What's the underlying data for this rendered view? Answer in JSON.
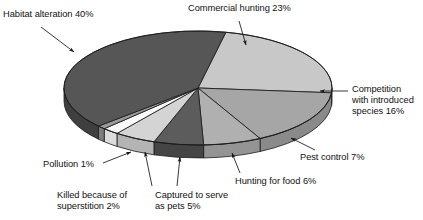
{
  "chart_data": {
    "type": "pie",
    "title": "",
    "subtitle": "",
    "xlabel": "",
    "ylabel": "",
    "grid": false,
    "legend_position": "none",
    "three_d": true,
    "total_percent": 100,
    "labels_show_percent": true,
    "categories": [
      "Habitat alteration",
      "Commercial hunting",
      "Competition with introduced species",
      "Pest control",
      "Hunting for food",
      "Captured to serve as pets",
      "Killed because of superstition",
      "Pollution"
    ],
    "values": [
      40,
      23,
      16,
      7,
      6,
      5,
      2,
      1
    ],
    "slices": [
      {
        "name": "Commercial hunting",
        "value": 23,
        "label": "Commercial hunting 23%",
        "color": "#c8c8c8",
        "side_color": "#a8a8a8"
      },
      {
        "name": "Competition with introduced species",
        "value": 16,
        "label": "Competition with introduced species 16%",
        "color": "#a6a6a6",
        "side_color": "#8a8a8a"
      },
      {
        "name": "Pest control",
        "value": 7,
        "label": "Pest control 7%",
        "color": "#b0b0b0",
        "side_color": "#949494"
      },
      {
        "name": "Hunting for food",
        "value": 6,
        "label": "Hunting for food 6%",
        "color": "#5c5c5c",
        "side_color": "#454545"
      },
      {
        "name": "Captured to serve as pets",
        "value": 5,
        "label": "Captured to serve as pets 5%",
        "color": "#d4d4d4",
        "side_color": "#b4b4b4"
      },
      {
        "name": "Killed because of superstition",
        "value": 2,
        "label": "Killed because of superstition 2%",
        "color": "#fbfbfb",
        "side_color": "#dcdcdc"
      },
      {
        "name": "Pollution",
        "value": 1,
        "label": "Pollution 1%",
        "color": "#9a9a9a",
        "side_color": "#7e7e7e"
      },
      {
        "name": "Habitat alteration",
        "value": 40,
        "label": "Habitat alteration 40%",
        "color": "#565656",
        "side_color": "#3f3f3f"
      }
    ],
    "colors": [
      "#565656",
      "#c8c8c8",
      "#a6a6a6",
      "#b0b0b0",
      "#5c5c5c",
      "#d4d4d4",
      "#fbfbfb",
      "#9a9a9a"
    ],
    "outline_color": "#1c1c1c",
    "background": "#ffffff"
  },
  "annotations": {
    "habitat": {
      "text": "Habitat alteration 40%"
    },
    "commercial": {
      "text": "Commercial hunting 23%"
    },
    "competition": {
      "line1": "Competition",
      "line2": "with introduced",
      "line3": "species 16%"
    },
    "pest": {
      "text": "Pest control 7%"
    },
    "hunting_food": {
      "text": "Hunting for food 6%"
    },
    "pets": {
      "line1": "Captured to serve",
      "line2": "as pets 5%"
    },
    "superstition": {
      "line1": "Killed because of",
      "line2": "superstition 2%"
    },
    "pollution": {
      "text": "Pollution 1%"
    }
  }
}
